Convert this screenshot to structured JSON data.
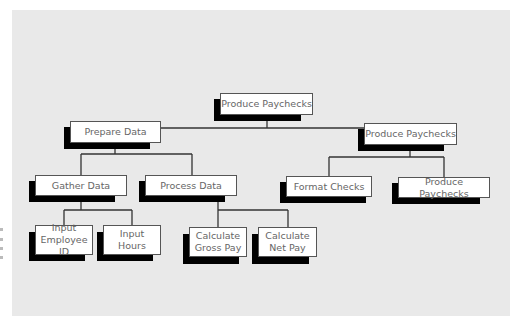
{
  "diagram": {
    "type": "hierarchy-chart",
    "colors": {
      "background": "#e9e9e9",
      "box": "#ffffff",
      "shadow": "#000000",
      "line": "#333333",
      "text": "#666666"
    },
    "nodes": [
      {
        "id": "root",
        "label": "Produce Paychecks",
        "parent": null
      },
      {
        "id": "prepare",
        "label": "Prepare Data",
        "parent": "root"
      },
      {
        "id": "produce",
        "label": "Produce Paychecks",
        "parent": "root"
      },
      {
        "id": "gather",
        "label": "Gather Data",
        "parent": "prepare"
      },
      {
        "id": "process",
        "label": "Process Data",
        "parent": "prepare"
      },
      {
        "id": "format",
        "label": "Format Checks",
        "parent": "produce"
      },
      {
        "id": "produce2",
        "label": "Produce Paychecks",
        "parent": "produce"
      },
      {
        "id": "empid",
        "label": "Input\nEmployee ID",
        "parent": "gather"
      },
      {
        "id": "hours",
        "label": "Input\nHours",
        "parent": "gather"
      },
      {
        "id": "gross",
        "label": "Calculate\nGross Pay",
        "parent": "process"
      },
      {
        "id": "net",
        "label": "Calculate\nNet Pay",
        "parent": "process"
      }
    ]
  }
}
